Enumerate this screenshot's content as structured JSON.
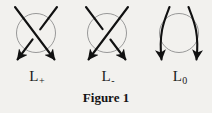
{
  "figure": {
    "caption": "Figure 1",
    "background_color": "#f2f1ee",
    "stroke_color": "#111111",
    "circle_color": "#8e8e8e",
    "diagrams": [
      {
        "id": "l-plus",
        "label_base": "L",
        "label_subscript": "+",
        "label_full": "L+",
        "description": "positive crossing",
        "over_strand": "northwest-to-southeast",
        "under_strand": "northeast-to-southwest"
      },
      {
        "id": "l-minus",
        "label_base": "L",
        "label_subscript": "-",
        "label_full": "L-",
        "description": "negative crossing",
        "over_strand": "northeast-to-southwest",
        "under_strand": "northwest-to-southeast"
      },
      {
        "id": "l-zero",
        "label_base": "L",
        "label_subscript": "0",
        "label_full": "L0",
        "description": "smoothed crossing",
        "over_strand": "none",
        "under_strand": "none"
      }
    ]
  }
}
